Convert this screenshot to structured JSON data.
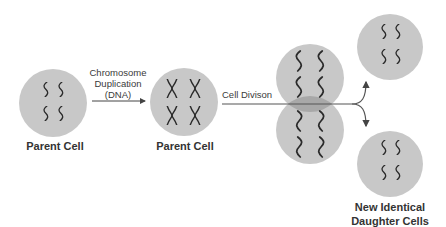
{
  "colors": {
    "cell_fill": "#c8c8c8",
    "overlap_fill": "#a8a8a8",
    "chromosome": "#2a2a2a",
    "arrow": "#444444",
    "text": "#333333"
  },
  "stages": [
    {
      "label": "Parent Cell",
      "chromosome_style": "single"
    },
    {
      "label": "Parent Cell",
      "chromosome_style": "duplicated-x"
    },
    {
      "label": "",
      "chromosome_style": "dividing"
    },
    {
      "label": "New Identical Daughter Cells",
      "label_lines": [
        "New Identical",
        "Daughter Cells"
      ],
      "chromosome_style": "single"
    }
  ],
  "arrows": [
    {
      "label_lines": [
        "Chromosome",
        "Duplication",
        "(DNA)"
      ]
    },
    {
      "label": "Cell Divison"
    }
  ]
}
